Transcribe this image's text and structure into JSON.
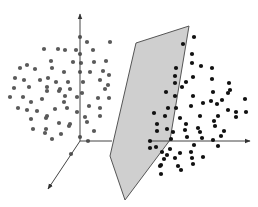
{
  "diagram": {
    "type": "3d-scatter-with-separating-hyperplane",
    "colors": {
      "background": "#ffffff",
      "class_a_point": "#5a5a5a",
      "class_b_point": "#111111",
      "plane_fill": "#cfcfcf",
      "plane_stroke": "#555555",
      "axis": "#444444"
    },
    "axes": {
      "origin": [
        80,
        141
      ],
      "y_end": [
        80,
        14
      ],
      "x_end": [
        250,
        141
      ],
      "z_end": [
        48,
        189
      ]
    },
    "plane": {
      "points": [
        [
          136,
          43
        ],
        [
          189,
          26
        ],
        [
          170,
          140
        ],
        [
          125,
          200
        ],
        [
          110,
          156
        ]
      ]
    },
    "class_a_points": [
      [
        80,
        37
      ],
      [
        87,
        42
      ],
      [
        110,
        42
      ],
      [
        44,
        49
      ],
      [
        58,
        49
      ],
      [
        65,
        50
      ],
      [
        76,
        50
      ],
      [
        93,
        50
      ],
      [
        51,
        61
      ],
      [
        80,
        54
      ],
      [
        81,
        63
      ],
      [
        73,
        62
      ],
      [
        94,
        62
      ],
      [
        106,
        61
      ],
      [
        27,
        65
      ],
      [
        20,
        68
      ],
      [
        35,
        69
      ],
      [
        52,
        68
      ],
      [
        64,
        72
      ],
      [
        80,
        72
      ],
      [
        90,
        72
      ],
      [
        103,
        71
      ],
      [
        109,
        75
      ],
      [
        15,
        78
      ],
      [
        24,
        80
      ],
      [
        40,
        80
      ],
      [
        48,
        78
      ],
      [
        56,
        82
      ],
      [
        68,
        82
      ],
      [
        83,
        82
      ],
      [
        100,
        80
      ],
      [
        108,
        85
      ],
      [
        14,
        88
      ],
      [
        29,
        87
      ],
      [
        47,
        87
      ],
      [
        60,
        89
      ],
      [
        70,
        89
      ],
      [
        47,
        91
      ],
      [
        59,
        91
      ],
      [
        82,
        93
      ],
      [
        105,
        89
      ],
      [
        10,
        97
      ],
      [
        23,
        97
      ],
      [
        42,
        99
      ],
      [
        65,
        96
      ],
      [
        77,
        97
      ],
      [
        98,
        98
      ],
      [
        109,
        98
      ],
      [
        18,
        108
      ],
      [
        31,
        102
      ],
      [
        64,
        102
      ],
      [
        89,
        106
      ],
      [
        100,
        108
      ],
      [
        27,
        110
      ],
      [
        37,
        111
      ],
      [
        47,
        116
      ],
      [
        55,
        109
      ],
      [
        67,
        108
      ],
      [
        77,
        112
      ],
      [
        85,
        117
      ],
      [
        100,
        116
      ],
      [
        31,
        119
      ],
      [
        46,
        118
      ],
      [
        59,
        123
      ],
      [
        70,
        124
      ],
      [
        87,
        122
      ],
      [
        33,
        129
      ],
      [
        46,
        129
      ],
      [
        61,
        134
      ],
      [
        69,
        126
      ],
      [
        80,
        137
      ],
      [
        88,
        141
      ],
      [
        45,
        133
      ],
      [
        52,
        139
      ],
      [
        94,
        131
      ],
      [
        71,
        154
      ]
    ],
    "class_b_points": [
      [
        194,
        37
      ],
      [
        183,
        44
      ],
      [
        192,
        54
      ],
      [
        192,
        63
      ],
      [
        201,
        66
      ],
      [
        212,
        68
      ],
      [
        176,
        68
      ],
      [
        175,
        76
      ],
      [
        193,
        77
      ],
      [
        212,
        79
      ],
      [
        229,
        83
      ],
      [
        175,
        83
      ],
      [
        186,
        82
      ],
      [
        228,
        93
      ],
      [
        182,
        87
      ],
      [
        213,
        92
      ],
      [
        230,
        90
      ],
      [
        166,
        92
      ],
      [
        175,
        96
      ],
      [
        193,
        96
      ],
      [
        203,
        103
      ],
      [
        217,
        104
      ],
      [
        245,
        99
      ],
      [
        168,
        108
      ],
      [
        176,
        108
      ],
      [
        191,
        106
      ],
      [
        211,
        101
      ],
      [
        222,
        100
      ],
      [
        236,
        112
      ],
      [
        154,
        113
      ],
      [
        165,
        116
      ],
      [
        180,
        118
      ],
      [
        200,
        116
      ],
      [
        218,
        116
      ],
      [
        228,
        110
      ],
      [
        157,
        124
      ],
      [
        167,
        129
      ],
      [
        186,
        124
      ],
      [
        198,
        128
      ],
      [
        214,
        121
      ],
      [
        236,
        117
      ],
      [
        246,
        112
      ],
      [
        157,
        131
      ],
      [
        173,
        132
      ],
      [
        185,
        130
      ],
      [
        200,
        132
      ],
      [
        215,
        126
      ],
      [
        224,
        131
      ],
      [
        150,
        141
      ],
      [
        171,
        139
      ],
      [
        187,
        137
      ],
      [
        202,
        138
      ],
      [
        213,
        140
      ],
      [
        221,
        136
      ],
      [
        150,
        148
      ],
      [
        156,
        147
      ],
      [
        162,
        152
      ],
      [
        170,
        149
      ],
      [
        180,
        153
      ],
      [
        191,
        152
      ],
      [
        194,
        145
      ],
      [
        167,
        155
      ],
      [
        175,
        158
      ],
      [
        192,
        158
      ],
      [
        218,
        146
      ],
      [
        164,
        159
      ],
      [
        203,
        157
      ],
      [
        161,
        165
      ],
      [
        193,
        164
      ],
      [
        178,
        166
      ],
      [
        181,
        170
      ],
      [
        161,
        174
      ],
      [
        160,
        166
      ]
    ]
  }
}
